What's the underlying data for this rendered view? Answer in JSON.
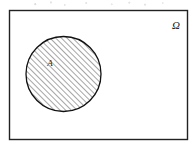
{
  "figure": {
    "caption": "",
    "background_color": "#ffffff",
    "canvas": {
      "width": 196,
      "height": 151
    }
  },
  "universe": {
    "name": "universal-set-rectangle",
    "label": "Ω",
    "label_x": 176,
    "label_y": 29,
    "rect": {
      "x": 9.5,
      "y": 10.5,
      "width": 178,
      "height": 129
    },
    "stroke_color": "#222222",
    "stroke_width": 1.4,
    "fill_color": "#ffffff"
  },
  "set_a": {
    "name": "set-a-circle",
    "label": "A",
    "label_x": 50,
    "label_y": 66,
    "center_x": 63.5,
    "center_y": 74,
    "radius": 37.5,
    "stroke_color": "#111111",
    "stroke_width": 1.3,
    "fill": "diagonal-hatch",
    "hatch": {
      "angle_degrees": 45,
      "direction": "bottom-left-to-top-right",
      "spacing_px": 4,
      "line_color": "#3a3a3a",
      "line_width": 0.9
    }
  },
  "labels": {
    "omega_symbol_name": "omega-symbol",
    "omega_font_size": 11,
    "a_font_size": 9
  }
}
